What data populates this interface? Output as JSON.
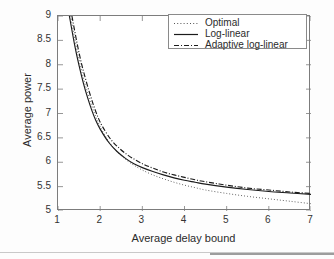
{
  "chart_data": {
    "type": "line",
    "title": "",
    "xlabel": "Average delay bound",
    "ylabel": "Average power",
    "xlim": [
      1,
      7
    ],
    "ylim": [
      5,
      9
    ],
    "xticks": [
      "1",
      "2",
      "3",
      "4",
      "5",
      "6",
      "7"
    ],
    "yticks": [
      "5",
      "5.5",
      "6",
      "6.5",
      "7",
      "7.5",
      "8",
      "8.5",
      "9"
    ],
    "grid": false,
    "legend_position": "top-right",
    "series": [
      {
        "name": "Optimal",
        "style": "dotted",
        "color": "#555555",
        "x": [
          1.3,
          1.4,
          1.5,
          1.6,
          1.7,
          1.8,
          1.9,
          2.0,
          2.2,
          2.4,
          2.6,
          2.8,
          3.0,
          3.25,
          3.5,
          3.75,
          4.0,
          4.25,
          4.5,
          5.0,
          5.5,
          6.0,
          6.5,
          7.0
        ],
        "y": [
          9.0,
          8.52,
          8.1,
          7.74,
          7.43,
          7.16,
          6.93,
          6.73,
          6.43,
          6.22,
          6.06,
          5.94,
          5.84,
          5.74,
          5.66,
          5.59,
          5.53,
          5.48,
          5.43,
          5.36,
          5.3,
          5.25,
          5.2,
          5.15
        ]
      },
      {
        "name": "Log-linear",
        "style": "solid",
        "color": "#1b1b1b",
        "x": [
          1.27,
          1.4,
          1.5,
          1.6,
          1.7,
          1.8,
          1.9,
          2.0,
          2.2,
          2.4,
          2.6,
          2.8,
          3.0,
          3.25,
          3.5,
          3.75,
          4.0,
          4.25,
          4.5,
          5.0,
          5.5,
          6.0,
          6.5,
          7.0
        ],
        "y": [
          9.0,
          8.38,
          7.98,
          7.63,
          7.33,
          7.07,
          6.85,
          6.68,
          6.41,
          6.22,
          6.08,
          5.97,
          5.89,
          5.81,
          5.74,
          5.68,
          5.63,
          5.59,
          5.55,
          5.49,
          5.44,
          5.4,
          5.37,
          5.34
        ]
      },
      {
        "name": "Adaptive log-linear",
        "style": "dash-dot",
        "color": "#1b1b1b",
        "x": [
          1.33,
          1.45,
          1.55,
          1.65,
          1.75,
          1.85,
          1.95,
          2.05,
          2.25,
          2.45,
          2.65,
          2.85,
          3.05,
          3.25,
          3.5,
          3.75,
          4.0,
          4.25,
          4.5,
          5.0,
          5.5,
          6.0,
          6.5,
          7.0
        ],
        "y": [
          9.0,
          8.45,
          8.05,
          7.72,
          7.42,
          7.15,
          6.92,
          6.74,
          6.47,
          6.29,
          6.15,
          6.04,
          5.95,
          5.88,
          5.8,
          5.74,
          5.69,
          5.64,
          5.6,
          5.53,
          5.47,
          5.43,
          5.39,
          5.36
        ]
      }
    ]
  },
  "legend": {
    "items": [
      {
        "label": "Optimal"
      },
      {
        "label": "Log-linear"
      },
      {
        "label": "Adaptive log-linear"
      }
    ]
  }
}
